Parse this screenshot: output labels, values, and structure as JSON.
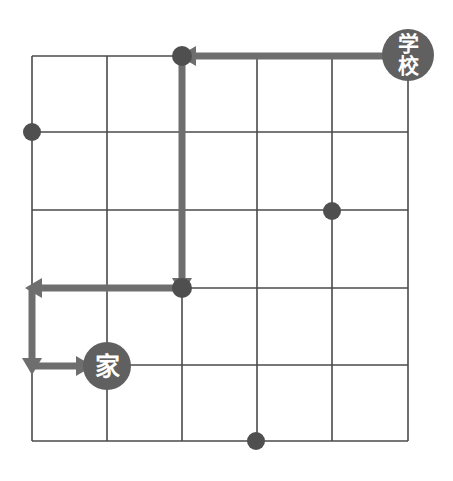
{
  "figure": {
    "width": 453,
    "height": 481,
    "background_color": "#ffffff"
  },
  "grid": {
    "name": "street-grid",
    "columns": 5,
    "rows": 5,
    "line_color": "#4a4a4a",
    "line_width": 1.6,
    "x_positions": [
      32,
      107,
      182,
      257,
      332,
      408
    ],
    "y_positions": [
      56,
      132,
      210,
      288,
      365,
      441
    ]
  },
  "markers": [
    {
      "id": "school",
      "name": "school-marker",
      "label_lines": [
        "学",
        "校"
      ],
      "label_text": "学校",
      "cx": 408,
      "cy": 55,
      "r": 26,
      "fill": "#606060",
      "text_color": "#ffffff"
    },
    {
      "id": "home",
      "name": "home-marker",
      "label_lines": [
        "家"
      ],
      "label_text": "家",
      "cx": 107,
      "cy": 366,
      "r": 24,
      "fill": "#606060",
      "text_color": "#ffffff"
    }
  ],
  "intersection_dots": [
    {
      "id": "dot-top-turn",
      "cx": 182,
      "cy": 56,
      "r": 10
    },
    {
      "id": "dot-left-edge",
      "cx": 32,
      "cy": 132,
      "r": 9
    },
    {
      "id": "dot-right-mid",
      "cx": 332,
      "cy": 211,
      "r": 9
    },
    {
      "id": "dot-mid-turn",
      "cx": 182,
      "cy": 288,
      "r": 10
    },
    {
      "id": "dot-bottom-edge",
      "cx": 256,
      "cy": 441,
      "r": 9
    }
  ],
  "route": {
    "name": "school-to-home-route",
    "stroke": "#6e6e6e",
    "stroke_width": 7,
    "segments": [
      {
        "id": "seg-top-west",
        "from": [
          408,
          56
        ],
        "to": [
          186,
          56
        ],
        "direction": "west",
        "arrowhead_at": [
          196,
          56
        ]
      },
      {
        "id": "seg-down-1",
        "from": [
          182,
          56
        ],
        "to": [
          182,
          284
        ],
        "direction": "south",
        "arrowhead_at": [
          182,
          278
        ]
      },
      {
        "id": "seg-mid-west",
        "from": [
          182,
          288
        ],
        "to": [
          32,
          288
        ],
        "direction": "west",
        "arrowhead_at": [
          42,
          288
        ]
      },
      {
        "id": "seg-down-2",
        "from": [
          32,
          288
        ],
        "to": [
          32,
          366
        ],
        "direction": "south",
        "arrowhead_at": [
          32,
          358
        ]
      },
      {
        "id": "seg-bottom-east",
        "from": [
          32,
          366
        ],
        "to": [
          86,
          366
        ],
        "direction": "east",
        "arrowhead_at": [
          76,
          366
        ]
      }
    ],
    "start": "school",
    "end": "home"
  }
}
